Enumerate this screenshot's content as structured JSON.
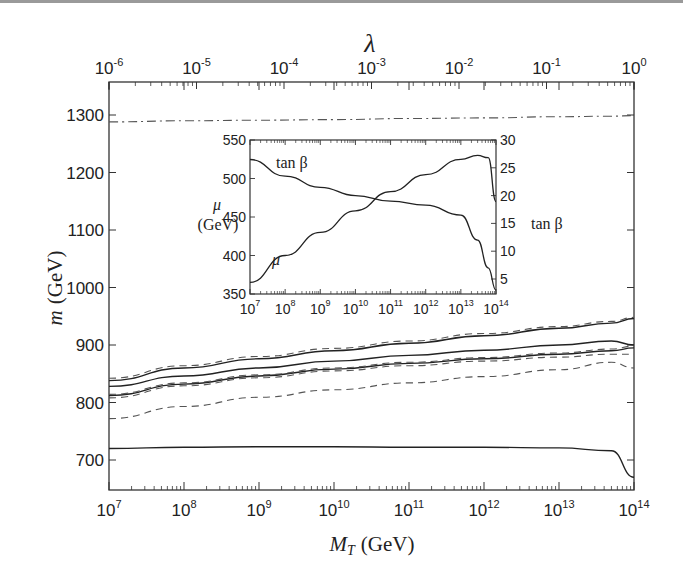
{
  "chart_data": [
    {
      "type": "line",
      "title": "",
      "xlabel": "M_T (GeV)",
      "ylabel": "m (GeV)",
      "top_xlabel": "λ",
      "xscale": "log",
      "xlim": [
        10000000.0,
        100000000000000.0
      ],
      "ylim": [
        650,
        1355
      ],
      "x_ticks": [
        "10^7",
        "10^8",
        "10^9",
        "10^10",
        "10^11",
        "10^12",
        "10^13",
        "10^14"
      ],
      "y_ticks": [
        700,
        800,
        900,
        1000,
        1100,
        1200,
        1300
      ],
      "top_x_ticks": [
        "10^-6",
        "10^-5",
        "10^-4",
        "10^-3",
        "10^-2",
        "10^-1",
        "10^0"
      ],
      "grid": false,
      "legend": null,
      "x": [
        10000000.0,
        100000000.0,
        1000000000.0,
        10000000000.0,
        100000000000.0,
        1000000000000.0,
        10000000000000.0,
        50000000000000.0,
        100000000000000.0
      ],
      "series": [
        {
          "name": "dash-dot (top)",
          "style": "dashdot",
          "values": [
            1288,
            1290,
            1291,
            1292,
            1294,
            1295,
            1297,
            1298,
            1299
          ]
        },
        {
          "name": "solid upper",
          "style": "solid",
          "values": [
            838,
            860,
            876,
            890,
            903,
            916,
            929,
            938,
            946
          ]
        },
        {
          "name": "dashed upper",
          "style": "dashed",
          "values": [
            842,
            864,
            880,
            894,
            907,
            920,
            932,
            941,
            948
          ]
        },
        {
          "name": "solid middle",
          "style": "solid",
          "values": [
            828,
            846,
            860,
            872,
            882,
            891,
            900,
            907,
            900
          ]
        },
        {
          "name": "solid lower-middle",
          "style": "solid",
          "values": [
            812,
            832,
            846,
            858,
            868,
            876,
            884,
            890,
            895
          ]
        },
        {
          "name": "dashed cluster 1",
          "style": "dashed",
          "values": [
            814,
            834,
            848,
            860,
            870,
            878,
            886,
            893,
            898
          ]
        },
        {
          "name": "dashed cluster 2",
          "style": "dashed",
          "values": [
            808,
            829,
            843,
            855,
            864,
            872,
            879,
            884,
            884
          ]
        },
        {
          "name": "dashed lower",
          "style": "dashed",
          "values": [
            772,
            793,
            809,
            822,
            834,
            845,
            857,
            870,
            860
          ]
        },
        {
          "name": "solid bottom",
          "style": "solid",
          "values": [
            720,
            722,
            723,
            723,
            722,
            722,
            721,
            716,
            670
          ]
        }
      ]
    },
    {
      "type": "line",
      "title": "inset",
      "xlabel": "",
      "ylabel": "μ (GeV)",
      "y2label": "tan β",
      "xscale": "log",
      "xlim": [
        10000000.0,
        100000000000000.0
      ],
      "ylim": [
        350,
        550
      ],
      "y2lim": [
        2.3,
        30
      ],
      "x_ticks": [
        "10^7",
        "10^8",
        "10^9",
        "10^10",
        "10^11",
        "10^12",
        "10^13",
        "10^14"
      ],
      "y_ticks": [
        350,
        400,
        450,
        500,
        550
      ],
      "y2_ticks": [
        5,
        10,
        15,
        20,
        25,
        30
      ],
      "x": [
        10000000.0,
        100000000.0,
        1000000000.0,
        10000000000.0,
        100000000000.0,
        1000000000000.0,
        10000000000000.0,
        30000000000000.0,
        60000000000000.0,
        100000000000000.0
      ],
      "series": [
        {
          "name": "μ",
          "axis": "left",
          "values": [
            365,
            400,
            430,
            458,
            483,
            505,
            525,
            530,
            527,
            470
          ]
        },
        {
          "name": "tan β",
          "axis": "right",
          "values": [
            26.5,
            23.5,
            21.5,
            20.0,
            19.0,
            18.3,
            16.5,
            12,
            7,
            3
          ]
        }
      ],
      "annotations": [
        "tan β",
        "μ"
      ]
    }
  ],
  "labels": {
    "top_axis_title": "λ",
    "y_axis_title_var": "m",
    "y_axis_title_unit": "(GeV)",
    "x_axis_title_var": "M",
    "x_axis_title_sub": "T",
    "x_axis_title_unit": "(GeV)",
    "inset_left_var": "μ",
    "inset_left_unit": "(GeV)",
    "inset_right": "tan β",
    "inset_curve_tanb": "tan β",
    "inset_curve_mu": "μ"
  }
}
